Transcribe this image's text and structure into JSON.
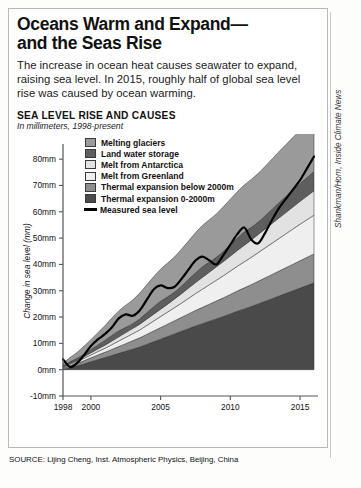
{
  "headline": "Oceans Warm and Expand—and the Seas Rise",
  "headline_line1": "Oceans Warm and Expand—",
  "headline_line2": "and the Seas Rise",
  "dek": "The increase in ocean heat causes seawater to expand, raising sea level. In 2015, roughly half of global sea level rise was caused by ocean warming.",
  "source": "SOURCE: Lijing Cheng, Inst. Atmospheric Physics, Beijing, China",
  "credit": "Shankman/Horn, Inside Climate News",
  "colors": {
    "glaciers": "#9a9a9a",
    "land_water": "#5e5e5e",
    "antarctica": "#e2e2e2",
    "greenland": "#efefef",
    "thermal_below": "#8e8e8e",
    "thermal_upper": "#4a4a4a",
    "measured_line": "#000000",
    "axis": "#555555",
    "frame": "#b8b8b4"
  },
  "chart_data": {
    "type": "area",
    "stacked": true,
    "title": "SEA LEVEL RISE AND CAUSES",
    "subtitle": "In millimeters, 1998-present",
    "xlabel": "",
    "ylabel": "Change in sea level (mm)",
    "ylim": [
      -10,
      85
    ],
    "xlim": [
      1998,
      2016
    ],
    "yticks": [
      -10,
      0,
      10,
      20,
      30,
      40,
      50,
      60,
      70,
      80
    ],
    "ytick_labels": [
      "-10mm",
      "0mm",
      "10mm",
      "20mm",
      "30mm",
      "40mm",
      "50mm",
      "60mm",
      "70mm",
      "80mm"
    ],
    "xticks": [
      1998,
      2000,
      2005,
      2010,
      2015
    ],
    "xtick_labels": [
      "1998",
      "2000",
      "2005",
      "2010",
      "2015"
    ],
    "grid": false,
    "legend_position": "inside-top-left",
    "x": [
      1998.0,
      1998.5,
      1999.0,
      1999.5,
      2000.0,
      2000.5,
      2001.0,
      2001.5,
      2002.0,
      2002.5,
      2003.0,
      2003.5,
      2004.0,
      2004.5,
      2005.0,
      2005.5,
      2006.0,
      2006.5,
      2007.0,
      2007.5,
      2008.0,
      2008.5,
      2009.0,
      2009.5,
      2010.0,
      2010.5,
      2011.0,
      2011.5,
      2012.0,
      2012.5,
      2013.0,
      2013.5,
      2014.0,
      2014.5,
      2015.0,
      2015.5,
      2016.0
    ],
    "series": [
      {
        "name": "Thermal expansion 0-2000m",
        "color": "#4a4a4a",
        "values": [
          0.0,
          0.8,
          1.4,
          2.2,
          3.0,
          3.8,
          4.6,
          5.4,
          6.2,
          7.0,
          7.8,
          8.6,
          9.6,
          10.6,
          11.6,
          12.6,
          13.6,
          14.6,
          15.6,
          16.6,
          17.5,
          18.4,
          19.3,
          20.2,
          21.2,
          22.2,
          23.1,
          24.0,
          25.0,
          26.0,
          27.0,
          28.0,
          29.0,
          30.0,
          31.0,
          32.0,
          33.0
        ]
      },
      {
        "name": "Thermal expansion below 2000m",
        "color": "#8e8e8e",
        "values": [
          0.5,
          0.8,
          1.0,
          1.2,
          1.5,
          1.8,
          2.0,
          2.3,
          2.6,
          2.9,
          3.2,
          3.5,
          3.8,
          4.1,
          4.4,
          4.7,
          5.0,
          5.3,
          5.6,
          5.9,
          6.2,
          6.5,
          6.8,
          7.1,
          7.4,
          7.7,
          8.0,
          8.3,
          8.6,
          8.9,
          9.2,
          9.5,
          9.8,
          10.1,
          10.4,
          10.7,
          11.0
        ]
      },
      {
        "name": "Melt from Greenland",
        "color": "#efefef",
        "values": [
          0.3,
          0.5,
          0.7,
          0.9,
          1.1,
          1.3,
          1.5,
          1.8,
          2.1,
          2.4,
          2.7,
          3.0,
          3.4,
          3.8,
          4.2,
          4.6,
          5.0,
          5.4,
          5.9,
          6.4,
          6.9,
          7.4,
          7.9,
          8.4,
          8.9,
          9.4,
          9.9,
          10.4,
          10.9,
          11.4,
          11.9,
          12.4,
          12.9,
          13.4,
          13.9,
          14.3,
          14.7
        ]
      },
      {
        "name": "Melt from Antarctica",
        "color": "#e2e2e2",
        "values": [
          0.2,
          0.3,
          0.4,
          0.6,
          0.8,
          1.0,
          1.2,
          1.4,
          1.6,
          1.8,
          2.0,
          2.2,
          2.4,
          2.6,
          2.8,
          3.0,
          3.3,
          3.6,
          3.9,
          4.2,
          4.5,
          4.8,
          5.1,
          5.4,
          5.7,
          6.0,
          6.3,
          6.6,
          6.9,
          7.2,
          7.5,
          7.8,
          8.1,
          8.4,
          8.7,
          9.0,
          9.3
        ]
      },
      {
        "name": "Land water storage",
        "color": "#5e5e5e",
        "values": [
          0.4,
          0.6,
          0.8,
          1.0,
          1.2,
          1.5,
          1.8,
          2.1,
          2.2,
          2.0,
          1.8,
          2.0,
          2.4,
          2.8,
          3.0,
          2.8,
          2.6,
          2.9,
          3.3,
          3.7,
          4.0,
          3.8,
          3.6,
          3.9,
          4.3,
          4.7,
          5.0,
          4.8,
          4.7,
          5.0,
          5.4,
          5.8,
          6.1,
          6.4,
          6.7,
          7.0,
          7.3
        ]
      },
      {
        "name": "Melting glaciers",
        "color": "#9a9a9a",
        "values": [
          1.0,
          1.6,
          2.2,
          3.0,
          3.8,
          4.6,
          5.6,
          6.6,
          7.6,
          8.4,
          9.0,
          9.8,
          10.6,
          11.4,
          12.2,
          12.8,
          13.4,
          14.0,
          14.6,
          15.2,
          15.7,
          16.1,
          16.5,
          16.9,
          17.3,
          17.6,
          17.9,
          18.2,
          18.5,
          18.8,
          19.1,
          19.4,
          19.7,
          20.0,
          20.3,
          20.6,
          21.0
        ]
      }
    ],
    "measured_sea_level": {
      "name": "Measured sea level",
      "color": "#000000",
      "values": [
        4.0,
        1.0,
        2.5,
        5.5,
        9.0,
        11.5,
        13.5,
        16.0,
        19.5,
        21.0,
        20.5,
        22.5,
        26.5,
        30.5,
        32.0,
        31.0,
        31.5,
        34.5,
        38.0,
        41.5,
        43.0,
        41.5,
        40.0,
        43.5,
        47.5,
        51.5,
        54.0,
        49.5,
        48.0,
        52.0,
        57.0,
        61.5,
        65.0,
        68.5,
        72.0,
        76.5,
        81.0
      ]
    },
    "legend": [
      {
        "label": "Melting glaciers",
        "color": "#9a9a9a",
        "marker": "swatch"
      },
      {
        "label": "Land water storage",
        "color": "#5e5e5e",
        "marker": "swatch"
      },
      {
        "label": "Melt from Antarctica",
        "color": "#e2e2e2",
        "marker": "swatch"
      },
      {
        "label": "Melt from Greenland",
        "color": "#efefef",
        "marker": "swatch"
      },
      {
        "label": "Thermal expansion below 2000m",
        "color": "#8e8e8e",
        "marker": "swatch"
      },
      {
        "label": "Thermal expansion 0-2000m",
        "color": "#4a4a4a",
        "marker": "swatch"
      },
      {
        "label": "Measured sea level",
        "color": "#000000",
        "marker": "line"
      }
    ]
  }
}
